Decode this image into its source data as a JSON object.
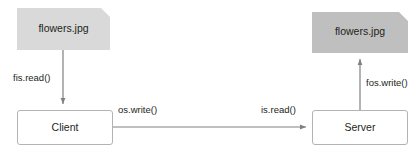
{
  "diagram": {
    "colors": {
      "source_document_fill": "#d9d9d9",
      "destination_document_fill": "#bfbfbf",
      "process_box_fill": "#ffffff",
      "process_box_border": "#b3b3b3",
      "arrow_color": "#808080",
      "text_color": "#231f20",
      "background": "#ffffff"
    },
    "documents": [
      {
        "id": "source",
        "label": "flowers.jpg",
        "shape": "document-folded-corner"
      },
      {
        "id": "destination",
        "label": "flowers.jpg",
        "shape": "document-folded-corner"
      }
    ],
    "nodes": [
      {
        "id": "client",
        "label": "Client",
        "shape": "rounded-rectangle"
      },
      {
        "id": "server",
        "label": "Server",
        "shape": "rounded-rectangle"
      }
    ],
    "edges": [
      {
        "id": "fis-read",
        "label": "fis.read()",
        "from": "source",
        "to": "client",
        "direction": "down"
      },
      {
        "id": "os-write",
        "label": "os.write()",
        "from": "client",
        "to": "server",
        "direction": "right"
      },
      {
        "id": "is-read",
        "label": "is.read()",
        "from": "client",
        "to": "server",
        "direction": "right"
      },
      {
        "id": "fos-write",
        "label": "fos.write()",
        "from": "server",
        "to": "destination",
        "direction": "up"
      }
    ]
  }
}
